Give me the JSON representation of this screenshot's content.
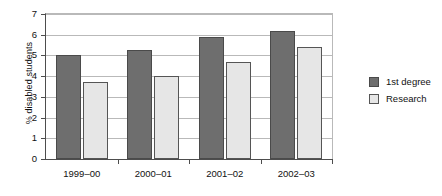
{
  "chart_data": {
    "type": "bar",
    "title": "",
    "xlabel": "",
    "ylabel": "% disabled students",
    "categories": [
      "1999–00",
      "2000–01",
      "2001–02",
      "2002–03"
    ],
    "series": [
      {
        "name": "1st degree",
        "color": "#6e6e6e",
        "values": [
          5.0,
          5.25,
          5.9,
          6.2
        ]
      },
      {
        "name": "Research",
        "color": "#e6e6e6",
        "values": [
          3.7,
          4.0,
          4.7,
          5.4
        ]
      }
    ],
    "ylim": [
      0,
      7
    ],
    "ytick_labels": [
      "0",
      "1",
      "2",
      "3",
      "4",
      "5",
      "6",
      "7"
    ],
    "ytick_values": [
      0,
      1,
      2,
      3,
      4,
      5,
      6,
      7
    ],
    "grid": "horizontal",
    "legend_position": "right"
  }
}
